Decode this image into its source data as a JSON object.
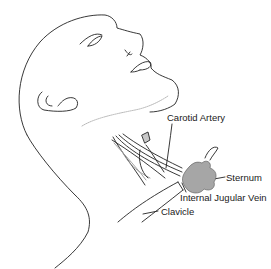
{
  "figure": {
    "colors": {
      "line": "#222222",
      "sternum_fill": "#a6a6a6",
      "background": "#ffffff"
    },
    "labels": {
      "carotid_artery": "Carotid Artery",
      "sternum": "Sternum",
      "internal_jugular_vein": "Internal Jugular Vein",
      "clavicle": "Clavicle"
    }
  }
}
